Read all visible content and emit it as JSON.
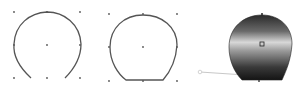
{
  "figure": {
    "panels": [
      {
        "id": "open-curve",
        "description": "Open arc path with 3x3 grid of anchor dots",
        "grid_points": [
          [
            14,
            12
          ],
          [
            47,
            12
          ],
          [
            80,
            12
          ],
          [
            14,
            45
          ],
          [
            47,
            45
          ],
          [
            80,
            45
          ],
          [
            14,
            78
          ],
          [
            47,
            78
          ],
          [
            80,
            78
          ]
        ],
        "path": "M31,78 C18,66 13,55 14,44 C15,24 30,13 47,12 C64,12 80,24 81,44 C81,56 75,68 65,78"
      },
      {
        "id": "closed-shape",
        "description": "Closed shape with flat bottom edge and 3x3 grid of anchor dots",
        "grid_points": [
          [
            109,
            14
          ],
          [
            143,
            14
          ],
          [
            177,
            14
          ],
          [
            109,
            47
          ],
          [
            143,
            47
          ],
          [
            177,
            47
          ],
          [
            109,
            81
          ],
          [
            143,
            81
          ],
          [
            177,
            81
          ]
        ],
        "path": "M126,80 C118,74 110,62 110,47 C110,28 124,15 143,15 C162,15 177,27 177,45 C176,60 170,72 163,80 Z"
      },
      {
        "id": "gradient-filled-shape",
        "description": "Shape filled with a metallic linear gradient with a gradient-handle line",
        "path": "M242,80 C234,72 229,60 229,47 C229,28 243,15 262,15 C280,15 292,27 292,44 C291,60 286,71 282,80 Z",
        "center_marker": [
          262,
          44
        ],
        "top_marker": [
          262,
          14
        ],
        "bottom_marker": [
          259,
          81
        ],
        "handle_line": {
          "x1": 200,
          "y1": 72,
          "x2": 245,
          "y2": 75
        },
        "gradient_stops": [
          {
            "offset": "0%",
            "color": "#2a2a2a"
          },
          {
            "offset": "25%",
            "color": "#6a6a6a"
          },
          {
            "offset": "42%",
            "color": "#d8d8d8"
          },
          {
            "offset": "55%",
            "color": "#9a9a9a"
          },
          {
            "offset": "80%",
            "color": "#3a3a3a"
          },
          {
            "offset": "100%",
            "color": "#141414"
          }
        ]
      }
    ],
    "colors": {
      "stroke": "#555555",
      "dot": "#555555",
      "handle": "#c8c8c8",
      "background": "#ffffff"
    }
  }
}
